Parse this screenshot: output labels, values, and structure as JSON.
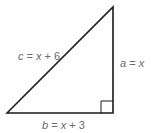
{
  "diagram": {
    "type": "right-triangle",
    "colors": {
      "stroke": "#1a1a1a",
      "label": "#6b6b6b",
      "background": "#ffffff"
    },
    "sides": {
      "hypotenuse": {
        "var": "c",
        "rest": " = ",
        "x": "x",
        "tail": " + 6"
      },
      "vertical": {
        "var": "a",
        "rest": " = ",
        "x": "x",
        "tail": ""
      },
      "base": {
        "var": "b",
        "rest": " = ",
        "x": "x",
        "tail": " + 3"
      }
    }
  }
}
